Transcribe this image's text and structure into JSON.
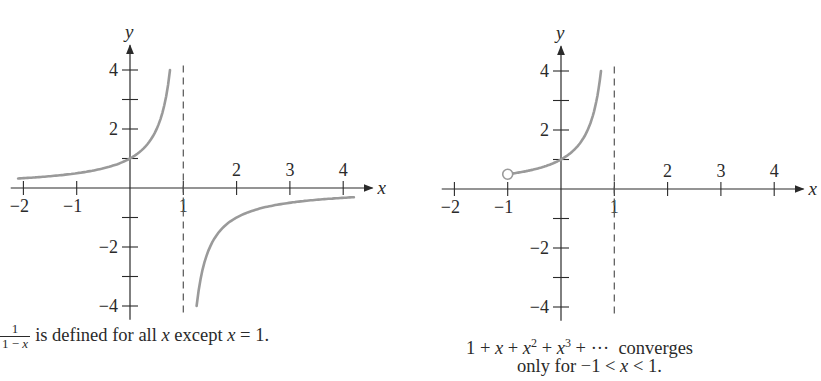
{
  "colors": {
    "axis": "#2a2a2a",
    "curve": "#9a9a9a",
    "asymptote": "#555555",
    "text": "#2a2a2a"
  },
  "chart_data": [
    {
      "type": "line",
      "title": "",
      "function": "y = 1/(1 - x)",
      "xlabel": "x",
      "ylabel": "y",
      "xlim": [
        -2.2,
        4.4
      ],
      "ylim": [
        -4.4,
        4.6
      ],
      "x_ticks": [
        -2,
        -1,
        1,
        2,
        3,
        4
      ],
      "x_tick_labels": [
        "−2",
        "−1",
        "1",
        "2",
        "3",
        "4"
      ],
      "y_ticks": [
        -4,
        -3,
        -2,
        -1,
        1,
        2,
        3,
        4
      ],
      "y_tick_labels": [
        "−4",
        "",
        "−2",
        "",
        "",
        "2",
        "",
        "4"
      ],
      "vertical_asymptote": 1,
      "series": [
        {
          "name": "left branch",
          "x": [
            -2.1,
            -2,
            -1,
            -0.5,
            0,
            0.25,
            0.5,
            0.6,
            0.7,
            0.75
          ],
          "y": [
            0.32,
            0.33,
            0.5,
            0.67,
            1,
            1.33,
            2,
            2.5,
            3.33,
            4
          ]
        },
        {
          "name": "right branch",
          "x": [
            1.25,
            1.3,
            1.5,
            2,
            2.5,
            3,
            3.5,
            4,
            4.2
          ],
          "y": [
            -4,
            -3.33,
            -2,
            -1,
            -0.67,
            -0.5,
            -0.4,
            -0.33,
            -0.31
          ]
        }
      ],
      "grid": false,
      "caption": {
        "fraction_numerator": "1",
        "fraction_denominator": "1 − x",
        "text_before_var": "is defined for all ",
        "var1": "x",
        "text_middle": " except ",
        "var2": "x",
        "text_end": " = 1."
      }
    },
    {
      "type": "line",
      "title": "",
      "function": "y = 1 + x + x^2 + x^3 + ... (partial: 1/(1-x) on -1<x<1)",
      "xlabel": "x",
      "ylabel": "y",
      "xlim": [
        -2.2,
        4.4
      ],
      "ylim": [
        -4.4,
        4.6
      ],
      "x_ticks": [
        -2,
        -1,
        1,
        2,
        3,
        4
      ],
      "x_tick_labels": [
        "−2",
        "−1",
        "1",
        "2",
        "3",
        "4"
      ],
      "y_ticks": [
        -4,
        -3,
        -2,
        -1,
        1,
        2,
        3,
        4
      ],
      "y_tick_labels": [
        "−4",
        "",
        "−2",
        "",
        "",
        "2",
        "",
        "4"
      ],
      "vertical_asymptote": 1,
      "open_circle": {
        "x": -1,
        "y": 0.5
      },
      "series": [
        {
          "name": "convergent series",
          "x": [
            -1,
            -0.5,
            0,
            0.25,
            0.5,
            0.6,
            0.7,
            0.75
          ],
          "y": [
            0.5,
            0.67,
            1,
            1.33,
            2,
            2.5,
            3.33,
            4
          ]
        }
      ],
      "grid": false,
      "caption": {
        "line1_series": "1 + x + x² + x³ + ···",
        "line1_word": "converges",
        "line2": "only for −1 < x < 1."
      }
    }
  ],
  "graphs": [
    {
      "origin_x": 130,
      "origin_y": 188,
      "unit_x": 53.3,
      "unit_y": 29.5
    },
    {
      "origin_x": 561,
      "origin_y": 189,
      "unit_x": 53.3,
      "unit_y": 29.5
    }
  ]
}
